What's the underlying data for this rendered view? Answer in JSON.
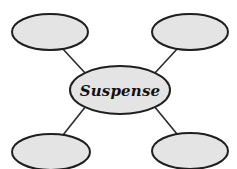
{
  "diagram": {
    "type": "spider-concept-map",
    "title_text": "Suspense",
    "background_color": "#ffffff",
    "node_fill_color": "#e4e4e4",
    "node_stroke_color": "#1f1f1f",
    "connector_color": "#2b2b2b",
    "center_node": {
      "label": "Suspense",
      "cx": 120,
      "cy": 90,
      "rx": 50,
      "ry": 24
    },
    "branch_nodes": [
      {
        "name": "top-left-node",
        "label": "",
        "cx": 50,
        "cy": 32,
        "rx": 38,
        "ry": 18
      },
      {
        "name": "top-right-node",
        "label": "",
        "cx": 190,
        "cy": 32,
        "rx": 38,
        "ry": 18
      },
      {
        "name": "bottom-left-node",
        "label": "",
        "cx": 51,
        "cy": 152,
        "rx": 39,
        "ry": 18
      },
      {
        "name": "bottom-right-node",
        "label": "",
        "cx": 190,
        "cy": 151,
        "rx": 38,
        "ry": 18
      }
    ],
    "connectors": [
      {
        "name": "connector-center-to-top-left",
        "x1": 86,
        "y1": 74,
        "x2": 62,
        "y2": 48
      },
      {
        "name": "connector-center-to-top-right",
        "x1": 154,
        "y1": 74,
        "x2": 178,
        "y2": 48
      },
      {
        "name": "connector-center-to-bottom-left",
        "x1": 86,
        "y1": 106,
        "x2": 63,
        "y2": 135
      },
      {
        "name": "connector-center-to-bottom-right",
        "x1": 154,
        "y1": 106,
        "x2": 177,
        "y2": 134
      }
    ]
  }
}
